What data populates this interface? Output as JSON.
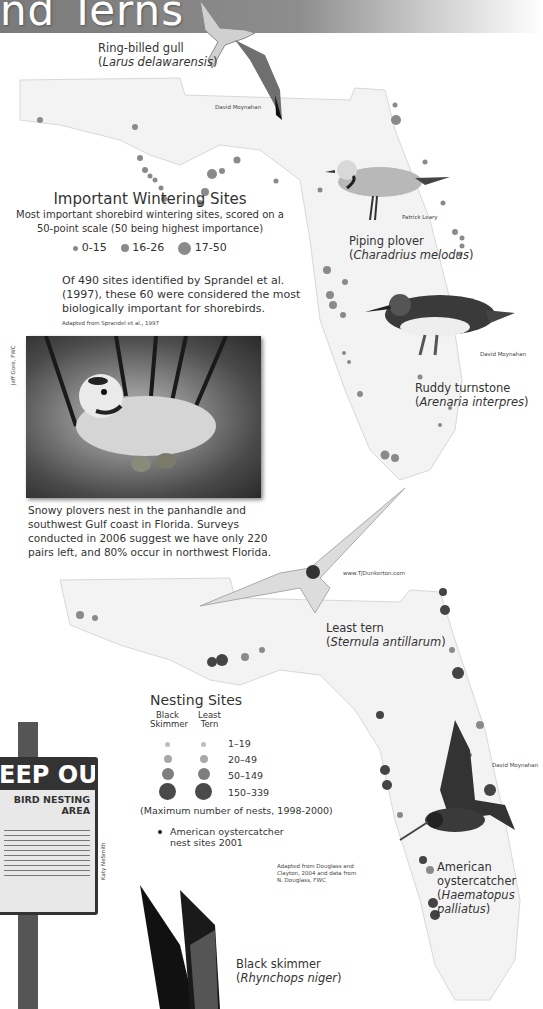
{
  "header": {
    "title": "nd Terns"
  },
  "birds": {
    "gull": {
      "name": "Ring-billed gull",
      "latin": "Larus delawarensis",
      "credit": "David Moynahan"
    },
    "plover": {
      "name": "Piping plover",
      "latin": "Charadrius melodus",
      "credit": "Patrick Leary"
    },
    "turnstone": {
      "name": "Ruddy turnstone",
      "latin": "Arenaria interpres",
      "credit": "David Moynahan"
    },
    "tern": {
      "name": "Least tern",
      "latin": "Sternula antillarum",
      "credit": "www.TJDunkerton.com"
    },
    "oystercatcher": {
      "name": "American oystercatcher",
      "latin": "Haematopus palliatus",
      "credit": "David Moynahan"
    },
    "skimmer": {
      "name": "Black skimmer",
      "latin": "Rhynchops niger"
    }
  },
  "wintering": {
    "title": "Important Wintering Sites",
    "subtitle_line1": "Most important shorebird wintering sites, scored on a",
    "subtitle_line2": "50-point scale (50 being highest importance)",
    "legend": [
      {
        "label": "0-15",
        "size": 5
      },
      {
        "label": "16-26",
        "size": 8
      },
      {
        "label": "17-50",
        "size": 13
      }
    ],
    "note_line1": "Of 490 sites identified by Sprandel et al.",
    "note_line2": "(1997), these 60 were considered the most",
    "note_line3": "biologically important for shorebirds.",
    "source": "Adapted from Sprandel et al., 1997"
  },
  "snowy_plover": {
    "credit": "Jeff Gore, FWC",
    "caption_line1": "Snowy plovers nest in the panhandle and",
    "caption_line2": "southwest Gulf coast in Florida. Surveys",
    "caption_line3": "conducted in 2006 suggest we have only 220",
    "caption_line4": "pairs left, and 80% occur in northwest Florida."
  },
  "nesting": {
    "title": "Nesting Sites",
    "col1_line1": "Black",
    "col1_line2": "Skimmer",
    "col2_line1": "Least",
    "col2_line2": "Tern",
    "rows": [
      {
        "label": "1–19",
        "size": 5,
        "color": "#bdbdbd"
      },
      {
        "label": "20–49",
        "size": 8,
        "color": "#a8a8a8"
      },
      {
        "label": "50–149",
        "size": 12,
        "color": "#7e7e7e"
      },
      {
        "label": "150–339",
        "size": 17,
        "color": "#4a4a4a"
      }
    ],
    "note": "(Maximum number of nests, 1998-2000)",
    "oyster_line1": "American oystercatcher",
    "oyster_line2": "nest sites 2001",
    "source_line1": "Adapted from Douglass and",
    "source_line2": "Clayton, 2004 and data from",
    "source_line3": "N. Douglass, FWC"
  },
  "sign": {
    "headline": "EEP OUT",
    "subhead_line1": "BIRD NESTING",
    "subhead_line2": "AREA",
    "credit": "Katy NeSmith"
  }
}
